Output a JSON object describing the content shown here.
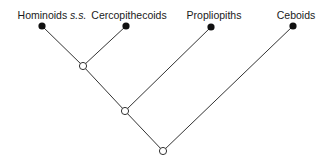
{
  "diagram": {
    "type": "cladogram",
    "colors": {
      "line": "#333333",
      "leaf_fill": "#111111",
      "node_fill": "#ffffff"
    },
    "taxa": [
      {
        "id": "hominoids",
        "label": "Hominoids",
        "label_suffix": "s.s.",
        "x": 42,
        "y": 26
      },
      {
        "id": "cercopithecoids",
        "label": "Cercopithecoids",
        "x": 126,
        "y": 26
      },
      {
        "id": "propliopiths",
        "label": "Propliopiths",
        "x": 211,
        "y": 27
      },
      {
        "id": "ceboids",
        "label": "Ceboids",
        "x": 293,
        "y": 26
      }
    ],
    "internal_nodes": [
      {
        "id": "n1",
        "x": 83,
        "y": 66,
        "children": [
          "hominoids",
          "cercopithecoids"
        ]
      },
      {
        "id": "n2",
        "x": 125,
        "y": 111,
        "children": [
          "n1",
          "propliopiths"
        ]
      },
      {
        "id": "n3",
        "x": 163,
        "y": 151,
        "children": [
          "n2",
          "ceboids"
        ]
      }
    ]
  }
}
